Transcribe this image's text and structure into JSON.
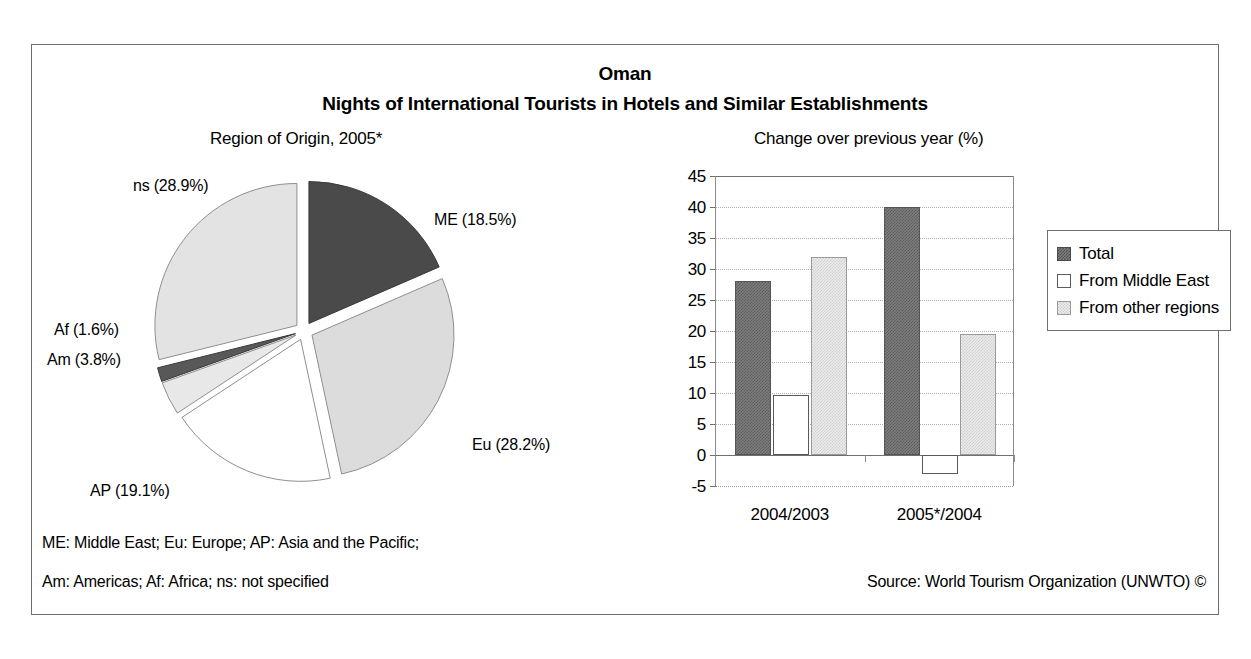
{
  "header": {
    "country": "Oman",
    "subtitle": "Nights of International Tourists in Hotels and Similar Establishments"
  },
  "panels": {
    "pie_title": "Region of Origin, 2005*",
    "bar_title": "Change over previous year (%)"
  },
  "footnotes": {
    "line1": "ME: Middle East; Eu: Europe; AP: Asia and the Pacific;",
    "line2": "Am: Americas; Af: Africa; ns: not specified",
    "source": "Source: World Tourism Organization (UNWTO) ©"
  },
  "colors": {
    "total": "#7e7e7e",
    "middle_east": "#ffffff",
    "other_regions": "#ececec",
    "pie_me": "#4a4a4a",
    "pie_eu": "#dcdcdc",
    "pie_ap": "#ffffff",
    "pie_am": "#e8e8e8",
    "pie_af": "#585858",
    "pie_ns": "#e3e3e3",
    "frame": "#6d6d6d",
    "axis": "#6f6f6f",
    "grid": "#b0b0b0"
  },
  "chart_data": [
    {
      "type": "pie",
      "title": "Region of Origin, 2005*",
      "unit": "%",
      "exploded": true,
      "labels": [
        "ME (18.5%)",
        "Eu (28.2%)",
        "AP (19.1%)",
        "Am (3.8%)",
        "Af (1.6%)",
        "ns (28.9%)"
      ],
      "categories": [
        "ME",
        "Eu",
        "AP",
        "Am",
        "Af",
        "ns"
      ],
      "category_names": [
        "Middle East",
        "Europe",
        "Asia and the Pacific",
        "Americas",
        "Africa",
        "not specified"
      ],
      "values": [
        18.5,
        28.2,
        19.1,
        3.8,
        1.6,
        28.9
      ],
      "slice_colors": [
        "#4a4a4a",
        "#dcdcdc",
        "#ffffff",
        "#e8e8e8",
        "#585858",
        "#e3e3e3"
      ],
      "legend": "none"
    },
    {
      "type": "bar",
      "title": "Change over previous year (%)",
      "xlabel": "",
      "ylabel": "",
      "ylim": [
        -5,
        45
      ],
      "ytick_step": 5,
      "ytick_labels": [
        "45",
        "40",
        "35",
        "30",
        "25",
        "20",
        "15",
        "10",
        "5",
        "0",
        "-5"
      ],
      "ytick_values": [
        45,
        40,
        35,
        30,
        25,
        20,
        15,
        10,
        5,
        0,
        -5
      ],
      "grid": true,
      "legend_position": "right",
      "categories": [
        "2004/2003",
        "2005*/2004"
      ],
      "series": [
        {
          "name": "Total",
          "values": [
            28.0,
            40.0
          ],
          "color": "#7e7e7e"
        },
        {
          "name": "From Middle East",
          "values": [
            9.7,
            -3.0
          ],
          "color": "#ffffff"
        },
        {
          "name": "From other regions",
          "values": [
            32.0,
            19.5
          ],
          "color": "#ececec"
        }
      ]
    }
  ]
}
